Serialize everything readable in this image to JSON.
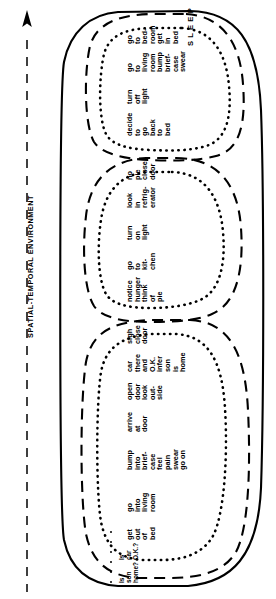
{
  "figure": {
    "axis_label": "SPATIAL-TEMPORAL ENVIRONMENT",
    "axis_arrow": "up-arrow-icon",
    "axis_line_style": "dashed",
    "top_label": "SLEEP"
  },
  "episodes": [
    {
      "id": "wake-check",
      "markers": [
        {
          "key": "w",
          "text": "Is"
        },
        {
          "key": "a",
          "text": "son"
        },
        {
          "key": "k",
          "text": "home?"
        },
        {
          "key": "e",
          "text": "Is"
        },
        {
          "key": "u",
          "text": "car"
        },
        {
          "key": "p",
          "text": "O.K.?"
        }
      ]
    }
  ],
  "columns": [
    {
      "id": "get-out-of-bed",
      "lines": [
        "get",
        "out",
        "of",
        "bed"
      ]
    },
    {
      "id": "go-into-living-room",
      "lines": [
        "go",
        "into",
        "living",
        "room"
      ]
    },
    {
      "id": "bump-into-briefcase",
      "lines": [
        "bump",
        "into",
        "brief-",
        "case",
        "feel",
        "pain",
        "swear",
        "go on"
      ]
    },
    {
      "id": "arrive-at-door",
      "lines": [
        "arrive",
        "at",
        "door"
      ]
    },
    {
      "id": "open-door-look-outside",
      "lines": [
        "open",
        "door",
        "look",
        "out-",
        "side"
      ]
    },
    {
      "id": "car-there-infer-son",
      "lines": [
        "car",
        "there",
        "and",
        "O.K.",
        "infer",
        "son",
        "is",
        "home"
      ]
    },
    {
      "id": "sigh-close-door",
      "lines": [
        "sigh",
        "close",
        "door"
      ]
    },
    {
      "id": "notice-hunger",
      "lines": [
        "notice",
        "hunger",
        "think",
        "of",
        "pie"
      ]
    },
    {
      "id": "go-to-kitchen",
      "lines": [
        "go",
        "to",
        "kit-",
        "chen"
      ]
    },
    {
      "id": "turn-on-light",
      "lines": [
        "turn",
        "on",
        "light"
      ]
    },
    {
      "id": "look-in-refrigerator",
      "lines": [
        "look",
        "in",
        "refrig-",
        "erator"
      ]
    },
    {
      "id": "no-pie-close-door",
      "lines": [
        "no",
        "pie",
        "close",
        "door"
      ]
    },
    {
      "id": "decide-go-back-to-bed",
      "lines": [
        "decide",
        "to",
        "go",
        "back",
        "to",
        "bed"
      ]
    },
    {
      "id": "turn-off-light",
      "lines": [
        "turn",
        "off",
        "light"
      ]
    },
    {
      "id": "go-to-living-room",
      "lines": [
        "go",
        "to",
        "living",
        "room",
        "bump",
        "brief-",
        "case",
        "swear"
      ]
    },
    {
      "id": "go-to-bedroom-get-in-bed",
      "lines": [
        "go",
        "to",
        "bed-",
        "room",
        "get",
        "in",
        "bed"
      ]
    }
  ],
  "colors": {
    "ink": "#000000",
    "background": "#ffffff"
  }
}
